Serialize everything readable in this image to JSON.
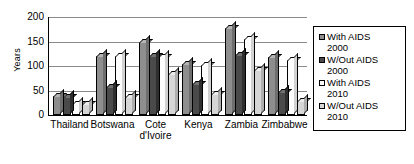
{
  "chart_data": {
    "type": "bar",
    "title": "",
    "xlabel": "",
    "ylabel": "Years",
    "ylim": [
      0,
      200
    ],
    "yticks": [
      0,
      50,
      100,
      150,
      200
    ],
    "grid": true,
    "legend_position": "right",
    "categories": [
      "Thailand",
      "Botswana",
      "Cote d'Ivoire",
      "Kenya",
      "Zambia",
      "Zimbabwe"
    ],
    "series": [
      {
        "name": "With AIDS 2000",
        "values": [
          38,
          120,
          148,
          104,
          177,
          119
        ]
      },
      {
        "name": "W/Out AIDS 2000",
        "values": [
          37,
          57,
          120,
          63,
          123,
          47
        ]
      },
      {
        "name": "With AIDS 2010",
        "values": [
          23,
          120,
          118,
          102,
          155,
          112
        ]
      },
      {
        "name": "W/Out AIDS 2010",
        "values": [
          22,
          37,
          83,
          43,
          92,
          29
        ]
      }
    ]
  },
  "legend": {
    "items": [
      {
        "label": "With AIDS\n2000",
        "color": "#8e8e8e"
      },
      {
        "label": "W/Out AIDS\n2000",
        "color": "#4a4a4a"
      },
      {
        "label": "With AIDS\n2010",
        "color": "#fdfdfd"
      },
      {
        "label": "W/Out AIDS\n2010",
        "color": "#d6d6d6"
      }
    ]
  }
}
